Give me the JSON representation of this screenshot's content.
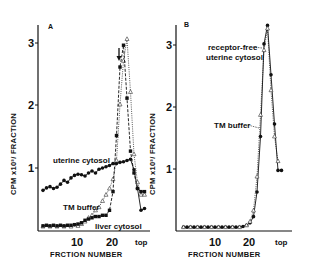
{
  "chart_data": [
    {
      "type": "line",
      "panel": "A",
      "title": "A",
      "xlabel": "FRCTION NUMBER",
      "ylabel": "CPM x10^-3 / FRACTION",
      "ylim": [
        0,
        3.3
      ],
      "xlim": [
        0,
        30
      ],
      "yticks": [
        "1",
        "2",
        "3"
      ],
      "xticks": [
        "10",
        "20",
        "top"
      ],
      "grid": false,
      "annotations": [
        "arrow marker at fraction ~22 near peak"
      ],
      "series": [
        {
          "name": "uterine cytosol",
          "marker": "filled-circle",
          "line": "solid",
          "x": [
            0,
            1,
            2,
            3,
            4,
            5,
            6,
            7,
            8,
            9,
            10,
            11,
            12,
            13,
            14,
            15,
            16,
            17,
            18,
            19,
            20,
            21,
            22,
            23,
            24,
            25,
            26,
            27,
            28,
            29
          ],
          "values": [
            0.62,
            0.66,
            0.68,
            0.65,
            0.67,
            0.72,
            0.78,
            0.75,
            0.82,
            0.86,
            0.88,
            0.87,
            0.85,
            0.9,
            0.93,
            0.9,
            0.96,
            0.98,
            1.0,
            1.02,
            1.05,
            1.05,
            1.07,
            1.08,
            1.1,
            1.12,
            0.95,
            0.65,
            0.3,
            0.33
          ]
        },
        {
          "name": "TM buffer",
          "marker": "open-triangle",
          "line": "dotted",
          "x": [
            0,
            2,
            4,
            6,
            8,
            10,
            11,
            12,
            13,
            14,
            15,
            16,
            17,
            18,
            19,
            20,
            21,
            22,
            23,
            24,
            25,
            26,
            27,
            28,
            29
          ],
          "values": [
            0.04,
            0.04,
            0.04,
            0.04,
            0.04,
            0.05,
            0.08,
            0.12,
            0.18,
            0.22,
            0.3,
            0.35,
            0.45,
            0.55,
            0.65,
            0.8,
            1.1,
            2.0,
            2.7,
            3.05,
            2.2,
            1.2,
            0.75,
            0.55,
            0.55
          ]
        },
        {
          "name": "liver cytosol",
          "marker": "filled-square",
          "line": "dashed",
          "x": [
            0,
            1,
            2,
            3,
            4,
            5,
            6,
            7,
            8,
            9,
            10,
            11,
            12,
            13,
            14,
            15,
            16,
            17,
            18,
            19,
            20,
            21,
            22,
            23,
            24,
            25,
            26,
            27,
            28,
            29
          ],
          "values": [
            0.05,
            0.06,
            0.05,
            0.06,
            0.05,
            0.06,
            0.05,
            0.06,
            0.06,
            0.07,
            0.08,
            0.1,
            0.14,
            0.16,
            0.18,
            0.2,
            0.2,
            0.22,
            0.22,
            0.3,
            0.6,
            1.5,
            2.6,
            2.95,
            2.1,
            1.25,
            0.9,
            0.65,
            0.6,
            0.6
          ]
        }
      ]
    },
    {
      "type": "line",
      "panel": "B",
      "title": "B",
      "xlabel": "FRCTION NUMBER",
      "ylabel": "CPM x10^-3 / FRACTION",
      "ylim": [
        0,
        3.3
      ],
      "xlim": [
        0,
        30
      ],
      "yticks": [
        "1",
        "2",
        "3"
      ],
      "xticks": [
        "10",
        "20",
        "top"
      ],
      "grid": false,
      "series": [
        {
          "name": "receptor-free uterine cytosol",
          "marker": "filled-circle",
          "line": "solid",
          "x": [
            1,
            2,
            3,
            4,
            5,
            6,
            7,
            8,
            9,
            10,
            11,
            12,
            13,
            14,
            15,
            16,
            17,
            18,
            19,
            20,
            21,
            22,
            23,
            24,
            25,
            26,
            27,
            28,
            29
          ],
          "values": [
            0.03,
            0.03,
            0.03,
            0.03,
            0.03,
            0.03,
            0.03,
            0.03,
            0.03,
            0.03,
            0.03,
            0.03,
            0.03,
            0.03,
            0.03,
            0.03,
            0.03,
            0.04,
            0.06,
            0.1,
            0.2,
            0.6,
            1.5,
            3.0,
            3.3,
            2.5,
            1.7,
            0.95,
            0.95
          ]
        },
        {
          "name": "TM buffer",
          "marker": "open-triangle",
          "line": "dotted",
          "x": [
            1,
            3,
            5,
            7,
            9,
            11,
            13,
            15,
            17,
            19,
            20,
            21,
            22,
            23,
            24,
            25,
            26,
            27,
            28
          ],
          "values": [
            0.03,
            0.03,
            0.03,
            0.03,
            0.03,
            0.03,
            0.03,
            0.03,
            0.03,
            0.06,
            0.12,
            0.3,
            0.85,
            1.85,
            2.9,
            3.25,
            2.25,
            1.5,
            1.1
          ]
        }
      ]
    }
  ],
  "panels": {
    "a": {
      "letter": "A",
      "ylabel": "CPM x10³/ FRACTION",
      "xlabel": "FRCTION NUMBER",
      "yticks": [
        "1",
        "2",
        "3"
      ],
      "xticks": [
        "10",
        "20",
        "top"
      ],
      "labels": {
        "uterine": "uterine cytosol",
        "tm": "TM buffer",
        "liver": "liver cytosol"
      }
    },
    "b": {
      "letter": "B",
      "ylabel": "CPM x10³/ FRACTION",
      "xlabel": "FRCTION NUMBER",
      "yticks": [
        "1",
        "2",
        "3"
      ],
      "xticks": [
        "10",
        "20",
        "top"
      ],
      "labels": {
        "rf1": "receptor-free",
        "rf2": "uterine cytosol",
        "tm": "TM buffer"
      }
    }
  }
}
